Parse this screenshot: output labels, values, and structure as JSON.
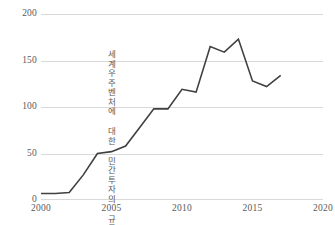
{
  "chart_data": {
    "type": "line",
    "title": "",
    "subtitle": "",
    "xlabel": "",
    "ylabel": "100만 달러(2018년)",
    "series_annotation": "세계우주벤처에 대한 민간투자의 규모",
    "grid": "horizontal",
    "legend_position": "none",
    "series_color": "#404040",
    "grid_color": "#D9D9D9",
    "tick_label_color": "#595959",
    "xlim": [
      2000,
      2020
    ],
    "ylim": [
      0,
      200
    ],
    "xticks": [
      "2000",
      "2005",
      "2010",
      "2015",
      "2020"
    ],
    "xtick_values": [
      2000,
      2005,
      2010,
      2015,
      2020
    ],
    "yticks": [
      "0",
      "50",
      "100",
      "150",
      "200"
    ],
    "ytick_values": [
      0,
      50,
      100,
      150,
      200
    ],
    "x": [
      2000,
      2001,
      2002,
      2003,
      2004,
      2005,
      2006,
      2007,
      2008,
      2009,
      2010,
      2011,
      2012,
      2013,
      2014,
      2015,
      2016,
      2017
    ],
    "series": [
      {
        "name": "세계우주벤처에 대한 민간투자의 규모",
        "values": [
          7,
          7,
          8,
          27,
          50,
          52,
          58,
          78,
          98,
          98,
          119,
          116,
          165,
          159,
          173,
          128,
          122,
          134
        ]
      }
    ]
  }
}
